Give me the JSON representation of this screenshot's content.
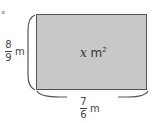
{
  "figure": {
    "type": "rectangle-area-diagram",
    "marker": "°",
    "fill_color": "#c8c8c8",
    "border_color": "#555555",
    "area_label": {
      "variable": "x",
      "unit": "m",
      "exponent": "2"
    },
    "height_label": {
      "numerator": "8",
      "denominator": "9",
      "unit": "m"
    },
    "width_label": {
      "numerator": "7",
      "denominator": "6",
      "unit": "m"
    }
  }
}
